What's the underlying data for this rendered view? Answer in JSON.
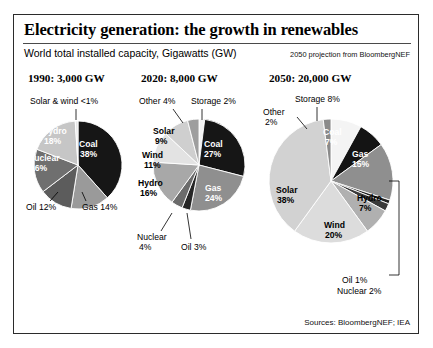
{
  "figure": {
    "title": "Electricity generation: the growth in renewables",
    "subtitle": "World total installed capacity, Gigawatts (GW)",
    "projection_note": "2050 projection from BloombergNEF",
    "sources": "Sources: BloombergNEF; IEA"
  },
  "chart_data": [
    {
      "type": "pie",
      "title": "1990: 3,000 GW",
      "year": "1990",
      "total_gw": 3000,
      "categories": [
        "Coal",
        "Gas",
        "Oil",
        "Nuclear",
        "Hydro",
        "Solar & wind"
      ],
      "values": [
        38,
        14,
        12,
        16,
        18,
        1
      ],
      "labels": [
        {
          "name": "coal",
          "text": "Coal",
          "value": "38%",
          "placement": "inside"
        },
        {
          "name": "gas",
          "text": "Gas 14%",
          "value": "14%",
          "placement": "outside"
        },
        {
          "name": "oil",
          "text": "Oil 12%",
          "value": "12%",
          "placement": "outside"
        },
        {
          "name": "nuclear",
          "text": "Nuclear",
          "value": "16%",
          "placement": "inside"
        },
        {
          "name": "hydro",
          "text": "Hydro",
          "value": "18%",
          "placement": "inside"
        },
        {
          "name": "solar-wind",
          "text": "Solar & wind <1%",
          "value": "<1%",
          "placement": "outside"
        }
      ],
      "colors": [
        "#161616",
        "#9a9a9a",
        "#5c5c5c",
        "#6f6f6f",
        "#c6c6c6",
        "#e8e8e8"
      ]
    },
    {
      "type": "pie",
      "title": "2020: 8,000 GW",
      "year": "2020",
      "total_gw": 8000,
      "categories": [
        "Storage",
        "Coal",
        "Gas",
        "Oil",
        "Nuclear",
        "Hydro",
        "Wind",
        "Solar",
        "Other"
      ],
      "values": [
        2,
        27,
        24,
        3,
        4,
        16,
        11,
        9,
        4
      ],
      "labels": [
        {
          "name": "storage",
          "text": "Storage 2%",
          "value": "2%",
          "placement": "outside"
        },
        {
          "name": "coal",
          "text": "Coal",
          "value": "27%",
          "placement": "inside"
        },
        {
          "name": "gas",
          "text": "Gas",
          "value": "24%",
          "placement": "inside"
        },
        {
          "name": "oil",
          "text": "Oil 3%",
          "value": "3%",
          "placement": "outside"
        },
        {
          "name": "nuclear",
          "text": "Nuclear",
          "value": "4%",
          "placement": "outside"
        },
        {
          "name": "hydro",
          "text": "Hydro",
          "value": "16%",
          "placement": "inside"
        },
        {
          "name": "wind",
          "text": "Wind",
          "value": "11%",
          "placement": "inside"
        },
        {
          "name": "solar",
          "text": "Solar",
          "value": "9%",
          "placement": "inside"
        },
        {
          "name": "other",
          "text": "Other 4%",
          "value": "4%",
          "placement": "outside"
        }
      ],
      "colors": [
        "#f2f2f2",
        "#161616",
        "#8f8f8f",
        "#262626",
        "#6b6b6b",
        "#a8a8a8",
        "#e3e3e3",
        "#cfcfcf",
        "#9e9e9e"
      ]
    },
    {
      "type": "pie",
      "title": "2050: 20,000 GW",
      "year": "2050",
      "total_gw": 20000,
      "categories": [
        "Storage",
        "Coal",
        "Gas",
        "Oil",
        "Nuclear",
        "Hydro",
        "Wind",
        "Solar",
        "Other"
      ],
      "values": [
        8,
        7,
        15,
        1,
        2,
        7,
        20,
        38,
        2
      ],
      "labels": [
        {
          "name": "storage",
          "text": "Storage 8%",
          "value": "8%",
          "placement": "outside"
        },
        {
          "name": "coal",
          "text": "Coal",
          "value": "7%",
          "placement": "inside"
        },
        {
          "name": "gas",
          "text": "Gas",
          "value": "15%",
          "placement": "inside"
        },
        {
          "name": "oil",
          "text": "Oil 1%",
          "value": "1%",
          "placement": "outside"
        },
        {
          "name": "nuclear",
          "text": "Nuclear 2%",
          "value": "2%",
          "placement": "outside"
        },
        {
          "name": "hydro",
          "text": "Hydro",
          "value": "7%",
          "placement": "inside"
        },
        {
          "name": "wind",
          "text": "Wind",
          "value": "20%",
          "placement": "inside"
        },
        {
          "name": "solar",
          "text": "Solar",
          "value": "38%",
          "placement": "inside"
        },
        {
          "name": "other",
          "text": "Other",
          "value": "2%",
          "placement": "outside"
        }
      ],
      "colors": [
        "#f4f4f4",
        "#141414",
        "#8f8f8f",
        "#202020",
        "#3a3a3a",
        "#b0b0b0",
        "#dcdcdc",
        "#d2d2d2",
        "#8a8a8a"
      ]
    }
  ]
}
